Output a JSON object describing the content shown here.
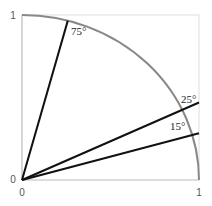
{
  "diagram": {
    "type": "unit-circle-angles",
    "axes": {
      "x_ticks": [
        "0",
        "1"
      ],
      "y_ticks": [
        "0",
        "1"
      ],
      "color": "#bbbbbb"
    },
    "arc": {
      "label": "unit circle quarter arc",
      "color": "#888888"
    },
    "rays": [
      {
        "angle_deg": 75,
        "label": "75°"
      },
      {
        "angle_deg": 25,
        "label": "25°"
      },
      {
        "angle_deg": 15,
        "label": "15°"
      }
    ],
    "ray_color": "#111111"
  }
}
